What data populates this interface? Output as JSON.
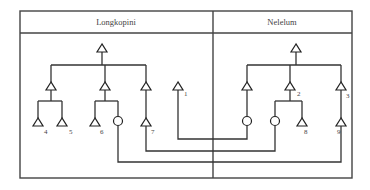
{
  "diagram": {
    "type": "kinship-diagram",
    "groups": [
      {
        "name": "Longkopini"
      },
      {
        "name": "Nelelum"
      }
    ],
    "labels": {
      "n1": "1",
      "n2": "2",
      "n3": "3",
      "n4": "4",
      "n5": "5",
      "n6": "6",
      "n7": "7",
      "n8": "8",
      "n9": "9"
    },
    "legend_symbols": {
      "triangle": "male",
      "circle": "female"
    },
    "colors": {
      "line": "#333333",
      "background": "#ffffff"
    }
  }
}
